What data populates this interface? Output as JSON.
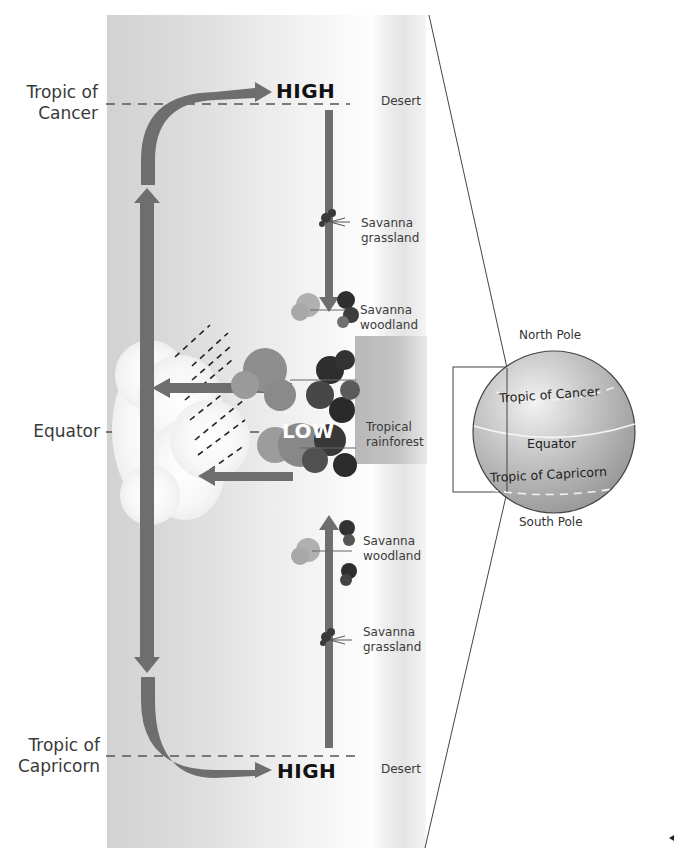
{
  "header": {
    "title_partial": "...cyclic pattern of winds and vegetation across the tropics..."
  },
  "latitudes": {
    "tropic_of_cancer": "Tropic of\nCancer",
    "tropic_of_cancer_line1": "Tropic of",
    "tropic_of_cancer_line2": "Cancer",
    "equator": "Equator",
    "tropic_of_capricorn_line1": "Tropic of",
    "tropic_of_capricorn_line2": "Capricorn"
  },
  "pressure": {
    "high_top": "HIGH",
    "low": "LOW",
    "high_bottom": "HIGH"
  },
  "vegetation": {
    "desert_top": "Desert",
    "savanna_grassland_top_1": "Savanna",
    "savanna_grassland_top_2": "grassland",
    "savanna_woodland_top_1": "Savanna",
    "savanna_woodland_top_2": "woodland",
    "tropical_rainforest_1": "Tropical",
    "tropical_rainforest_2": "rainforest",
    "savanna_woodland_bottom_1": "Savanna",
    "savanna_woodland_bottom_2": "woodland",
    "savanna_grassland_bottom_1": "Savanna",
    "savanna_grassland_bottom_2": "grassland",
    "desert_bottom": "Desert"
  },
  "globe": {
    "north_pole": "North Pole",
    "tropic_of_cancer": "Tropic of Cancer",
    "equator": "Equator",
    "tropic_of_capricorn": "Tropic of Capricorn",
    "south_pole": "South Pole"
  },
  "colors": {
    "arrow": "#6e6e6e",
    "band": "#d6d6d6",
    "globe": "#bdbdbd",
    "text": "#333333"
  }
}
